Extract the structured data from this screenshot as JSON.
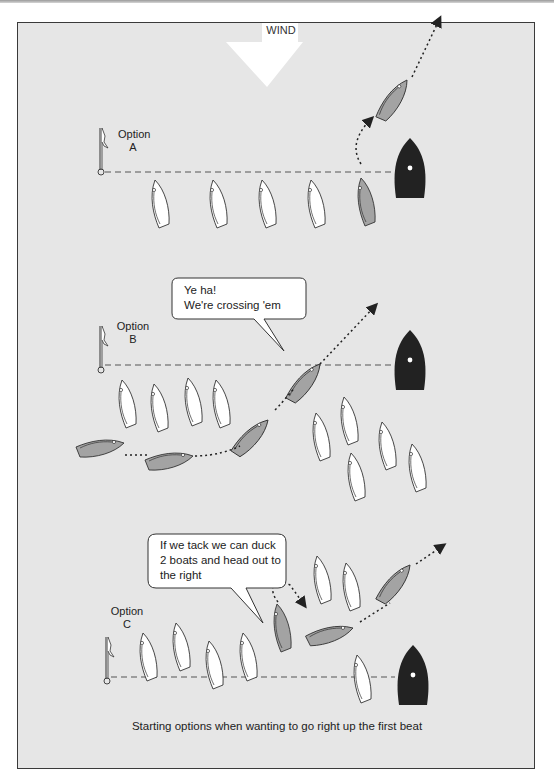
{
  "diagram": {
    "wind_label": "WIND",
    "options": [
      {
        "label_line1": "Option",
        "label_line2": "A"
      },
      {
        "label_line1": "Option",
        "label_line2": "B"
      },
      {
        "label_line1": "Option",
        "label_line2": "C"
      }
    ],
    "bubbles": [
      {
        "line1": "Ye ha!",
        "line2": "We're crossing 'em"
      },
      {
        "line1": "If we tack we can duck",
        "line2": "2 boats and head out to",
        "line3": "the right"
      }
    ],
    "caption": "Starting options when wanting to go right up the first beat",
    "colors": {
      "background": "#e6e6e6",
      "frame_border": "#3a3a3a",
      "our_boat": "#a3a3a3",
      "committee_boat": "#222222",
      "other_boats": "#ffffff",
      "wind_arrow": "#ffffff"
    }
  }
}
